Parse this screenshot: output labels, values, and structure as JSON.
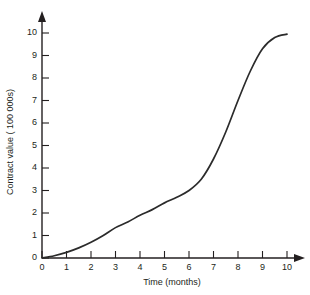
{
  "chart_data": {
    "type": "line",
    "title": "",
    "subtitle": "",
    "xlabel": "Time (months)",
    "ylabel": "Contract value ( 100 000s)",
    "xlim": [
      0,
      10
    ],
    "ylim": [
      0,
      10
    ],
    "xticks": [
      "0",
      "1",
      "2",
      "3",
      "4",
      "5",
      "6",
      "7",
      "8",
      "9",
      "10"
    ],
    "yticks": [
      "0",
      "1",
      "2",
      "3",
      "4",
      "5",
      "6",
      "7",
      "8",
      "9",
      "10"
    ],
    "grid": false,
    "legend": false,
    "legend_position": "none",
    "annotations": [],
    "series": [
      {
        "name": "Contract value",
        "curve_shape": "sigmoid (S-curve)",
        "color": "#2b2b2b",
        "x": [
          0,
          0.5,
          1,
          1.5,
          2,
          2.5,
          3,
          3.5,
          4,
          4.5,
          5,
          5.5,
          6,
          6.5,
          7,
          7.5,
          8,
          8.5,
          9,
          9.5,
          10
        ],
        "values": [
          0,
          0.1,
          0.25,
          0.45,
          0.7,
          1.0,
          1.35,
          1.6,
          1.9,
          2.15,
          2.45,
          2.7,
          3.0,
          3.5,
          4.4,
          5.6,
          7.0,
          8.3,
          9.3,
          9.8,
          9.95
        ]
      }
    ]
  },
  "axes": {
    "x_arrow": "arrow-right",
    "y_arrow": "arrow-up"
  }
}
